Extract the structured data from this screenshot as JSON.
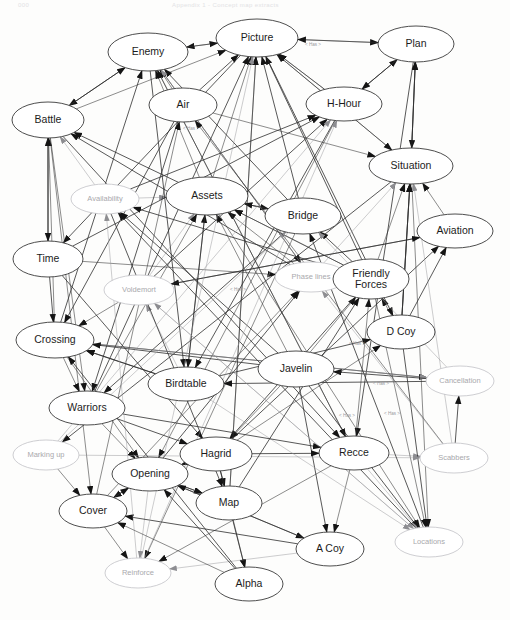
{
  "document": {
    "kind": "scanned-figure",
    "header_left": "000",
    "header_right": "Appendix 1 - Concept map extracts",
    "background_color": "#fdfdfc",
    "node_stroke_color": "#3a3a3a",
    "faint_node_color": "#c2c2c6",
    "edge_color": "#2d2d2d",
    "label_color": "#1c1c1c",
    "faint_label_color": "#a9a9ad"
  },
  "graph": {
    "type": "directed-concept-map",
    "node_count": 31,
    "nodes": [
      {
        "id": "enemy",
        "label": "Enemy",
        "x": 148,
        "y": 52,
        "rx": 40,
        "ry": 19,
        "emphasis": "strong"
      },
      {
        "id": "picture",
        "label": "Picture",
        "x": 257,
        "y": 38,
        "rx": 41,
        "ry": 19,
        "emphasis": "strong"
      },
      {
        "id": "plan",
        "label": "Plan",
        "x": 416,
        "y": 44,
        "rx": 38,
        "ry": 18,
        "emphasis": "strong"
      },
      {
        "id": "air",
        "label": "Air",
        "x": 183,
        "y": 105,
        "rx": 34,
        "ry": 17,
        "emphasis": "strong"
      },
      {
        "id": "hhour",
        "label": "H-Hour",
        "x": 344,
        "y": 104,
        "rx": 38,
        "ry": 17,
        "emphasis": "strong"
      },
      {
        "id": "battle",
        "label": "Battle",
        "x": 48,
        "y": 120,
        "rx": 36,
        "ry": 18,
        "emphasis": "strong"
      },
      {
        "id": "situation",
        "label": "Situation",
        "x": 411,
        "y": 166,
        "rx": 42,
        "ry": 18,
        "emphasis": "strong"
      },
      {
        "id": "availability",
        "label": "Availability",
        "x": 105,
        "y": 199,
        "rx": 34,
        "ry": 15,
        "emphasis": "faint"
      },
      {
        "id": "assets",
        "label": "Assets",
        "x": 207,
        "y": 196,
        "rx": 41,
        "ry": 19,
        "emphasis": "strong"
      },
      {
        "id": "bridge",
        "label": "Bridge",
        "x": 303,
        "y": 216,
        "rx": 38,
        "ry": 18,
        "emphasis": "strong"
      },
      {
        "id": "aviation",
        "label": "Aviation",
        "x": 455,
        "y": 231,
        "rx": 38,
        "ry": 17,
        "emphasis": "strong"
      },
      {
        "id": "time",
        "label": "Time",
        "x": 48,
        "y": 259,
        "rx": 35,
        "ry": 18,
        "emphasis": "strong"
      },
      {
        "id": "phaselines",
        "label": "Phase lines",
        "x": 311,
        "y": 277,
        "rx": 36,
        "ry": 15,
        "emphasis": "faint"
      },
      {
        "id": "friendlyforces",
        "label": "Friendly Forces",
        "x": 371,
        "y": 279,
        "rx": 38,
        "ry": 20,
        "emphasis": "strong",
        "two_line": true
      },
      {
        "id": "voldemort",
        "label": "Voldemort",
        "x": 139,
        "y": 290,
        "rx": 35,
        "ry": 15,
        "emphasis": "faint"
      },
      {
        "id": "dcoy",
        "label": "D Coy",
        "x": 401,
        "y": 332,
        "rx": 34,
        "ry": 17,
        "emphasis": "strong"
      },
      {
        "id": "crossing",
        "label": "Crossing",
        "x": 55,
        "y": 340,
        "rx": 39,
        "ry": 18,
        "emphasis": "strong"
      },
      {
        "id": "javelin",
        "label": "Javelin",
        "x": 296,
        "y": 369,
        "rx": 38,
        "ry": 18,
        "emphasis": "strong"
      },
      {
        "id": "birdtable",
        "label": "Birdtable",
        "x": 186,
        "y": 384,
        "rx": 38,
        "ry": 17,
        "emphasis": "strong"
      },
      {
        "id": "cancellation",
        "label": "Cancellation",
        "x": 460,
        "y": 381,
        "rx": 34,
        "ry": 15,
        "emphasis": "faint"
      },
      {
        "id": "warriors",
        "label": "Warriors",
        "x": 87,
        "y": 408,
        "rx": 38,
        "ry": 17,
        "emphasis": "strong"
      },
      {
        "id": "markingup",
        "label": "Marking up",
        "x": 46,
        "y": 455,
        "rx": 33,
        "ry": 15,
        "emphasis": "faint"
      },
      {
        "id": "hagrid",
        "label": "Hagrid",
        "x": 216,
        "y": 454,
        "rx": 36,
        "ry": 17,
        "emphasis": "strong"
      },
      {
        "id": "recce",
        "label": "Recce",
        "x": 354,
        "y": 453,
        "rx": 35,
        "ry": 17,
        "emphasis": "strong"
      },
      {
        "id": "scabbers",
        "label": "Scabbers",
        "x": 454,
        "y": 458,
        "rx": 34,
        "ry": 15,
        "emphasis": "faint"
      },
      {
        "id": "opening",
        "label": "Opening",
        "x": 150,
        "y": 474,
        "rx": 38,
        "ry": 17,
        "emphasis": "strong"
      },
      {
        "id": "map",
        "label": "Map",
        "x": 229,
        "y": 503,
        "rx": 33,
        "ry": 17,
        "emphasis": "strong"
      },
      {
        "id": "cover",
        "label": "Cover",
        "x": 93,
        "y": 511,
        "rx": 34,
        "ry": 17,
        "emphasis": "strong"
      },
      {
        "id": "locations",
        "label": "Locations",
        "x": 429,
        "y": 542,
        "rx": 34,
        "ry": 15,
        "emphasis": "faint"
      },
      {
        "id": "acoy",
        "label": "A Coy",
        "x": 330,
        "y": 549,
        "rx": 34,
        "ry": 17,
        "emphasis": "strong"
      },
      {
        "id": "reinforce",
        "label": "Reinforce",
        "x": 138,
        "y": 573,
        "rx": 33,
        "ry": 15,
        "emphasis": "faint"
      },
      {
        "id": "alpha",
        "label": "Alpha",
        "x": 249,
        "y": 584,
        "rx": 34,
        "ry": 17,
        "emphasis": "strong"
      }
    ],
    "edge_label_text": "< Has >",
    "edge_labels": [
      {
        "text": "< Has >",
        "x": 313,
        "y": 46
      },
      {
        "text": "< Has >",
        "x": 191,
        "y": 130
      },
      {
        "text": "< Has >",
        "x": 238,
        "y": 291
      },
      {
        "text": "< Has >",
        "x": 357,
        "y": 345
      },
      {
        "text": "< Has >",
        "x": 381,
        "y": 385
      },
      {
        "text": "< Has >",
        "x": 392,
        "y": 415
      },
      {
        "text": "< Has >",
        "x": 347,
        "y": 417
      }
    ],
    "edges": [
      {
        "from": "picture",
        "to": "enemy"
      },
      {
        "from": "enemy",
        "to": "picture"
      },
      {
        "from": "picture",
        "to": "plan"
      },
      {
        "from": "plan",
        "to": "picture"
      },
      {
        "from": "enemy",
        "to": "battle"
      },
      {
        "from": "battle",
        "to": "enemy"
      },
      {
        "from": "air",
        "to": "enemy"
      },
      {
        "from": "air",
        "to": "picture"
      },
      {
        "from": "hhour",
        "to": "plan"
      },
      {
        "from": "hhour",
        "to": "picture"
      },
      {
        "from": "battle",
        "to": "picture"
      },
      {
        "from": "assets",
        "to": "enemy"
      },
      {
        "from": "assets",
        "to": "picture"
      },
      {
        "from": "assets",
        "to": "battle"
      },
      {
        "from": "bridge",
        "to": "enemy"
      },
      {
        "from": "bridge",
        "to": "picture"
      },
      {
        "from": "situation",
        "to": "picture"
      },
      {
        "from": "situation",
        "to": "plan"
      },
      {
        "from": "availability",
        "to": "battle"
      },
      {
        "from": "availability",
        "to": "assets"
      },
      {
        "from": "time",
        "to": "battle"
      },
      {
        "from": "battle",
        "to": "time"
      },
      {
        "from": "time",
        "to": "crossing"
      },
      {
        "from": "crossing",
        "to": "battle"
      },
      {
        "from": "voldemort",
        "to": "crossing"
      },
      {
        "from": "voldemort",
        "to": "assets"
      },
      {
        "from": "friendlyforces",
        "to": "situation"
      },
      {
        "from": "friendlyforces",
        "to": "bridge"
      },
      {
        "from": "friendlyforces",
        "to": "assets"
      },
      {
        "from": "friendlyforces",
        "to": "picture"
      },
      {
        "from": "phaselines",
        "to": "friendlyforces"
      },
      {
        "from": "phaselines",
        "to": "assets"
      },
      {
        "from": "aviation",
        "to": "situation"
      },
      {
        "from": "dcoy",
        "to": "friendlyforces"
      },
      {
        "from": "dcoy",
        "to": "situation"
      },
      {
        "from": "javelin",
        "to": "assets"
      },
      {
        "from": "javelin",
        "to": "friendlyforces"
      },
      {
        "from": "javelin",
        "to": "locations"
      },
      {
        "from": "birdtable",
        "to": "crossing"
      },
      {
        "from": "birdtable",
        "to": "assets"
      },
      {
        "from": "birdtable",
        "to": "voldemort"
      },
      {
        "from": "crossing",
        "to": "warriors"
      },
      {
        "from": "warriors",
        "to": "opening"
      },
      {
        "from": "warriors",
        "to": "hagrid"
      },
      {
        "from": "markingup",
        "to": "cover"
      },
      {
        "from": "opening",
        "to": "cover"
      },
      {
        "from": "opening",
        "to": "reinforce"
      },
      {
        "from": "opening",
        "to": "map"
      },
      {
        "from": "hagrid",
        "to": "map"
      },
      {
        "from": "hagrid",
        "to": "opening"
      },
      {
        "from": "hagrid",
        "to": "alpha"
      },
      {
        "from": "map",
        "to": "alpha"
      },
      {
        "from": "cover",
        "to": "reinforce"
      },
      {
        "from": "recce",
        "to": "scabbers"
      },
      {
        "from": "recce",
        "to": "locations"
      },
      {
        "from": "recce",
        "to": "acoy"
      },
      {
        "from": "scabbers",
        "to": "cancellation"
      },
      {
        "from": "javelin",
        "to": "acoy"
      },
      {
        "from": "friendlyforces",
        "to": "locations"
      },
      {
        "from": "dcoy",
        "to": "locations"
      },
      {
        "from": "hagrid",
        "to": "recce"
      },
      {
        "from": "crossing",
        "to": "opening"
      }
    ]
  }
}
